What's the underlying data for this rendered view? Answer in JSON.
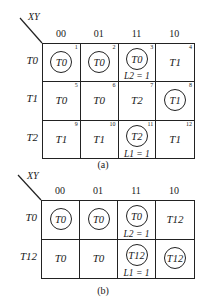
{
  "figures": [
    {
      "id": "a",
      "caption": "(a)",
      "axis_label": "XY",
      "columns": [
        "00",
        "01",
        "11",
        "10"
      ],
      "rows": [
        {
          "label": "T0",
          "cells": [
            {
              "value": "T0",
              "circled": true,
              "num": "1",
              "output": ""
            },
            {
              "value": "T0",
              "circled": true,
              "num": "2",
              "output": ""
            },
            {
              "value": "T0",
              "circled": true,
              "num": "3",
              "output": "L2 = 1"
            },
            {
              "value": "T1",
              "circled": false,
              "num": "4",
              "output": ""
            }
          ]
        },
        {
          "label": "T1",
          "cells": [
            {
              "value": "T0",
              "circled": false,
              "num": "5",
              "output": ""
            },
            {
              "value": "T0",
              "circled": false,
              "num": "6",
              "output": ""
            },
            {
              "value": "T2",
              "circled": false,
              "num": "7",
              "output": ""
            },
            {
              "value": "T1",
              "circled": true,
              "num": "8",
              "output": ""
            }
          ]
        },
        {
          "label": "T2",
          "cells": [
            {
              "value": "T1",
              "circled": false,
              "num": "9",
              "output": ""
            },
            {
              "value": "T1",
              "circled": false,
              "num": "10",
              "output": ""
            },
            {
              "value": "T2",
              "circled": true,
              "num": "11",
              "output": "L1 = 1"
            },
            {
              "value": "T1",
              "circled": false,
              "num": "12",
              "output": ""
            }
          ]
        }
      ]
    },
    {
      "id": "b",
      "caption": "(b)",
      "axis_label": "XY",
      "columns": [
        "00",
        "01",
        "11",
        "10"
      ],
      "rows": [
        {
          "label": "T0",
          "cells": [
            {
              "value": "T0",
              "circled": true,
              "num": "",
              "output": ""
            },
            {
              "value": "T0",
              "circled": true,
              "num": "",
              "output": ""
            },
            {
              "value": "T0",
              "circled": true,
              "num": "",
              "output": "L2 = 1"
            },
            {
              "value": "T12",
              "circled": false,
              "num": "",
              "output": ""
            }
          ]
        },
        {
          "label": "T12",
          "cells": [
            {
              "value": "T0",
              "circled": false,
              "num": "",
              "output": ""
            },
            {
              "value": "T0",
              "circled": false,
              "num": "",
              "output": ""
            },
            {
              "value": "T12",
              "circled": true,
              "num": "",
              "output": "L1 = 1"
            },
            {
              "value": "T12",
              "circled": true,
              "num": "",
              "output": ""
            }
          ]
        }
      ]
    }
  ]
}
